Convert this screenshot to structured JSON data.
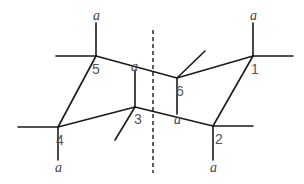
{
  "diagram": {
    "title": "",
    "type": "cyclohexane ring flip (chair conformation) with C2 axis",
    "atoms": [
      {
        "id": "1",
        "label": "1",
        "x": 253,
        "y": 56
      },
      {
        "id": "2",
        "label": "2",
        "x": 213,
        "y": 126
      },
      {
        "id": "3",
        "label": "3",
        "x": 135,
        "y": 107
      },
      {
        "id": "4",
        "label": "4",
        "x": 58,
        "y": 127
      },
      {
        "id": "5",
        "label": "5",
        "x": 96,
        "y": 56
      },
      {
        "id": "6",
        "label": "6",
        "x": 177,
        "y": 78
      }
    ],
    "axial_label": "a",
    "axial_labels": [
      {
        "atom": "5",
        "text": "a"
      },
      {
        "atom": "1",
        "text": "a"
      },
      {
        "atom": "3",
        "text": "a"
      },
      {
        "atom": "6",
        "text": "a"
      },
      {
        "atom": "4",
        "text": "a"
      },
      {
        "atom": "2",
        "text": "a"
      }
    ],
    "colors": {
      "line": "#1a1a1a",
      "text": "#555555",
      "background": "#ffffff"
    }
  }
}
